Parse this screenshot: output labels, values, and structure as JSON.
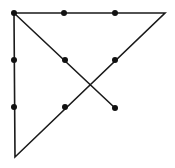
{
  "diagram": {
    "colors": {
      "background": "#ffffff",
      "stroke": "#1a1a1a",
      "dot": "#111111"
    },
    "dots": [
      {
        "x": 14,
        "y": 13
      },
      {
        "x": 64,
        "y": 13
      },
      {
        "x": 115,
        "y": 13
      },
      {
        "x": 14,
        "y": 60
      },
      {
        "x": 65,
        "y": 60
      },
      {
        "x": 115,
        "y": 60
      },
      {
        "x": 14,
        "y": 107
      },
      {
        "x": 65,
        "y": 107
      },
      {
        "x": 115,
        "y": 108
      }
    ],
    "path": [
      {
        "x": 14,
        "y": 13
      },
      {
        "x": 165,
        "y": 13
      },
      {
        "x": 15,
        "y": 157
      },
      {
        "x": 14,
        "y": 13
      },
      {
        "x": 115,
        "y": 108
      }
    ]
  }
}
